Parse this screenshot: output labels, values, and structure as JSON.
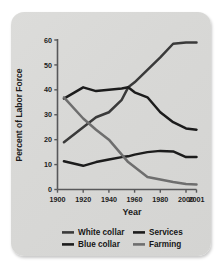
{
  "chart_data": {
    "type": "line",
    "title": "",
    "xlabel": "Year",
    "ylabel": "Percent of Labor Force",
    "xlim": [
      1900,
      2001
    ],
    "ylim": [
      0,
      60
    ],
    "xticks": [
      1900,
      1920,
      1940,
      1960,
      1980,
      2000,
      2001
    ],
    "xtick_labels": [
      "1900",
      "1920",
      "1940",
      "1960",
      "1980",
      "2000",
      "2001"
    ],
    "yticks": [
      0,
      10,
      20,
      30,
      40,
      50,
      60
    ],
    "ytick_labels": [
      "0",
      "10",
      "20",
      "30",
      "40",
      "50",
      "60"
    ],
    "grid": false,
    "legend_position": "bottom",
    "x": [
      1905,
      1920,
      1930,
      1940,
      1950,
      1955,
      1960,
      1970,
      1980,
      1990,
      2000,
      2001
    ],
    "series": [
      {
        "name": "White collar",
        "color": "#3a3a3a",
        "values": [
          19,
          25,
          29,
          31,
          36,
          41,
          43,
          48,
          53,
          58.5,
          59,
          59
        ]
      },
      {
        "name": "Blue collar",
        "color": "#1c1c1c",
        "values": [
          36.5,
          41,
          39.5,
          40,
          40.5,
          41,
          39,
          37,
          31,
          27,
          24.5,
          24
        ]
      },
      {
        "name": "Services",
        "color": "#1c1c1c",
        "values": [
          11.3,
          9.5,
          11,
          12,
          13,
          13.3,
          14,
          15,
          15.5,
          15.3,
          13,
          13
        ]
      },
      {
        "name": "Farming",
        "color": "#6e6e6e",
        "values": [
          37,
          28.5,
          24,
          20,
          14,
          11,
          9,
          5,
          4,
          3,
          2.2,
          2
        ]
      }
    ]
  },
  "legend": {
    "items": [
      {
        "label": "White collar",
        "color": "#3a3a3a"
      },
      {
        "label": "Services",
        "color": "#1c1c1c"
      },
      {
        "label": "Blue collar",
        "color": "#1c1c1c"
      },
      {
        "label": "Farming",
        "color": "#6e6e6e"
      }
    ]
  },
  "axis": {
    "x_title": "Year",
    "y_title": "Percent of Labor Force",
    "axis_color": "#58585a"
  }
}
